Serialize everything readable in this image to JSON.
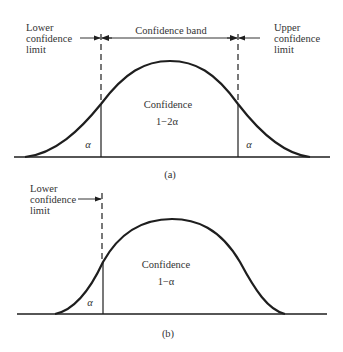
{
  "panel_a": {
    "caption": "(a)",
    "lower_limit_label": [
      "Lower",
      "confidence",
      "limit"
    ],
    "upper_limit_label": [
      "Upper",
      "confidence",
      "limit"
    ],
    "band_label": "Confidence band",
    "center_label": "Confidence",
    "center_value": "1−2α",
    "left_tail_label": "α",
    "right_tail_label": "α"
  },
  "panel_b": {
    "caption": "(b)",
    "lower_limit_label": [
      "Lower",
      "confidence",
      "limit"
    ],
    "center_label": "Confidence",
    "center_value": "1−α",
    "left_tail_label": "α"
  },
  "colors": {
    "line": "#1e1e1e",
    "text": "#333333",
    "background": "#ffffff"
  }
}
